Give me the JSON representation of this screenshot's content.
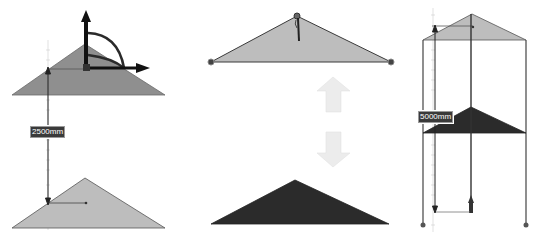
{
  "panels": [
    {
      "id": "move-roof",
      "dimension_label": "2500mm",
      "gizmo": "move-rotate-gizmo"
    },
    {
      "id": "toggle-roof",
      "arrows": [
        "up-arrow",
        "down-arrow"
      ]
    },
    {
      "id": "stack-roof",
      "dimension_label": "5000mm"
    }
  ],
  "colors": {
    "roof_light": "#bdbdbd",
    "roof_mid": "#8f8f8f",
    "roof_dark": "#2b2b2b",
    "line": "#333333",
    "arrow_fill": "#ececec"
  }
}
